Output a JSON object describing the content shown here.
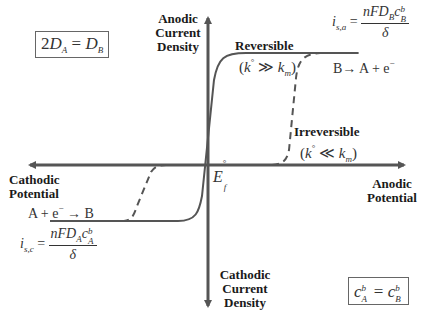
{
  "diagram": {
    "type": "current-potential curves (steady-state voltammogram)",
    "axes": {
      "y_positive_label": "Anodic Current Density",
      "y_negative_label": "Cathodic Current Density",
      "x_positive_label": "Anodic Potential",
      "x_negative_label": "Cathodic Potential",
      "origin_label": "E_f°"
    },
    "labels": {
      "anodic_y_line1": "Anodic",
      "anodic_y_line2": "Current",
      "anodic_y_line3": "Density",
      "cathodic_y_line1": "Cathodic",
      "cathodic_y_line2": "Current",
      "cathodic_y_line3": "Density",
      "anodic_x_line1": "Anodic",
      "anodic_x_line2": "Potential",
      "cathodic_x_line1": "Cathodic",
      "cathodic_x_line2": "Potential",
      "origin_E": "E",
      "origin_sup": "°",
      "origin_sub": "f"
    },
    "curves": [
      {
        "name": "Reversible",
        "condition": "(k° ≫ k_m)",
        "style": "solid",
        "label": "Reversible",
        "condition_k": "k",
        "condition_sup": "°",
        "condition_op": "≫",
        "condition_km": "k",
        "condition_km_sub": "m"
      },
      {
        "name": "Irreversible",
        "condition": "(k° ≪ k_m)",
        "style": "dashed",
        "label": "Irreversible",
        "condition_k": "k",
        "condition_sup": "°",
        "condition_op": "≪",
        "condition_km": "k",
        "condition_km_sub": "m"
      }
    ],
    "anodic_limit": {
      "lhs_i": "i",
      "lhs_sub": "s,a",
      "eq": "=",
      "num_n": "nFD",
      "num_sub": "B",
      "num_c": "c",
      "num_c_sup": "b",
      "num_c_sub": "B",
      "den": "δ",
      "reaction_left": "B",
      "reaction_arrow": "→",
      "reaction_right": "A + e",
      "reaction_sup": "−"
    },
    "cathodic_limit": {
      "lhs_i": "i",
      "lhs_sub": "s,c",
      "eq": "=",
      "num_n": "nFD",
      "num_sub": "A",
      "num_c": "c",
      "num_c_sup": "b",
      "num_c_sub": "A",
      "den": "δ",
      "reaction_left": "A + e",
      "reaction_sup": "−",
      "reaction_arrow": "→",
      "reaction_right": "B"
    },
    "conditions": {
      "diffusion": {
        "coef": "2",
        "D1": "D",
        "D1_sub": "A",
        "eq": "=",
        "D2": "D",
        "D2_sub": "B",
        "text": "2D_A = D_B"
      },
      "concentration": {
        "c1": "c",
        "c1_sup": "b",
        "c1_sub": "A",
        "eq": "=",
        "c2": "c",
        "c2_sup": "b",
        "c2_sub": "B",
        "text": "c_A^b = c_B^b"
      }
    },
    "colors": {
      "axis": "#555555",
      "curve": "#555555",
      "text": "#1a1a1a",
      "box_border": "#666666",
      "background": "#ffffff"
    }
  }
}
